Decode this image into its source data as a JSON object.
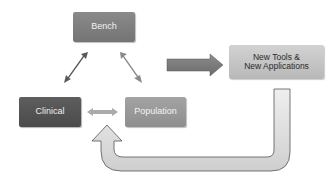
{
  "diagram": {
    "type": "flow-cycle",
    "nodes": {
      "bench": {
        "label": "Bench",
        "color": "#7f7f7f"
      },
      "clinical": {
        "label": "Clinical",
        "color": "#555555"
      },
      "population": {
        "label": "Population",
        "color": "#999999"
      },
      "new_tools": {
        "line1": "New Tools &",
        "line2": "New Applications",
        "color": "#c4c4c4"
      }
    },
    "edges": [
      {
        "from": "bench",
        "to": "clinical",
        "style": "double-headed",
        "color": "#5a5a5a"
      },
      {
        "from": "bench",
        "to": "population",
        "style": "double-headed",
        "color": "#8a8a8a"
      },
      {
        "from": "clinical",
        "to": "population",
        "style": "double-headed",
        "color": "#aaaaaa"
      },
      {
        "from": "triangle",
        "to": "new_tools",
        "style": "block-arrow",
        "color": "#7a7a7a"
      },
      {
        "from": "new_tools",
        "to": "clinical-population",
        "style": "u-turn-arrow",
        "color": "#d8d8d8"
      }
    ]
  }
}
